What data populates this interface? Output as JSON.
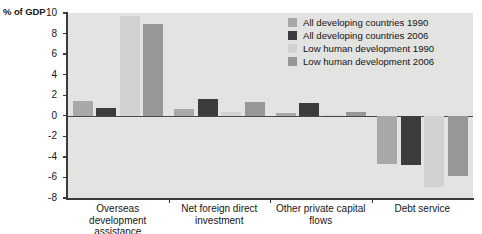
{
  "chart_data": {
    "type": "bar",
    "title": "",
    "subtitle": "",
    "xlabel": "",
    "ylabel": "% of GDP",
    "ylim": [
      -8,
      10
    ],
    "ytick_step": 2,
    "yticks": [
      "10",
      "8",
      "6",
      "4",
      "2",
      "0",
      "-2",
      "-4",
      "-6",
      "-8"
    ],
    "grid": false,
    "legend_position": "top-right",
    "categories": [
      "Overseas development assistance",
      "Net foreign direct investment",
      "Other private capital flows",
      "Debt service"
    ],
    "series": [
      {
        "name": "All developing countries 1990",
        "color": "#a8a8a6",
        "values": [
          1.4,
          0.7,
          0.3,
          -4.7
        ]
      },
      {
        "name": "All developing countries 2006",
        "color": "#3c3c3e",
        "values": [
          0.8,
          1.6,
          1.2,
          -4.8
        ]
      },
      {
        "name": "Low human development 1990",
        "color": "#d2d2d0",
        "values": [
          9.7,
          0.4,
          0.1,
          -6.9
        ]
      },
      {
        "name": "Low human development 2006",
        "color": "#979795",
        "values": [
          8.9,
          1.3,
          0.35,
          -5.9
        ]
      }
    ]
  },
  "legend": {
    "items": [
      {
        "label": "All developing countries 1990"
      },
      {
        "label": "All developing countries 2006"
      },
      {
        "label": "Low human development 1990"
      },
      {
        "label": "Low human development 2006"
      }
    ]
  },
  "colors": {
    "plot_background": "#e3e3e1",
    "axis": "#3a3a3a",
    "text": "#161616"
  }
}
